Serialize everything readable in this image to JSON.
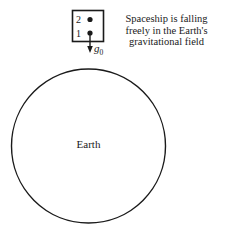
{
  "diagram": {
    "spaceship": {
      "point_labels": [
        "2",
        "1"
      ],
      "acceleration_label": "g",
      "acceleration_subscript": "0"
    },
    "caption_lines": [
      "Spaceship is falling",
      "freely in the Earth's",
      "gravitational field"
    ],
    "earth_label": "Earth",
    "colors": {
      "stroke": "#1a1a1a",
      "background": "#ffffff"
    }
  }
}
